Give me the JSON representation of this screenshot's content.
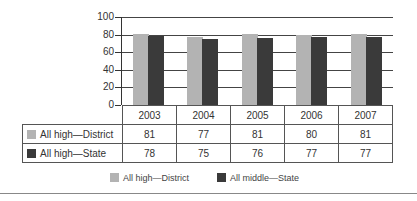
{
  "chart_data": {
    "type": "bar",
    "title": "",
    "xlabel": "",
    "ylabel": "",
    "ylim": [
      0,
      100
    ],
    "yticks": [
      0,
      20,
      40,
      60,
      80,
      100
    ],
    "grid": true,
    "categories": [
      "2003",
      "2004",
      "2005",
      "2006",
      "2007"
    ],
    "series": [
      {
        "name": "All high—District",
        "color": "#b3b3b3",
        "values": [
          81,
          77,
          81,
          80,
          81
        ]
      },
      {
        "name": "All high—State",
        "color": "#3a3a3a",
        "values": [
          78,
          75,
          76,
          77,
          77
        ]
      }
    ],
    "data_table": true,
    "legend": {
      "position": "bottom",
      "entries": [
        {
          "label": "All high—District",
          "color": "#b3b3b3"
        },
        {
          "label": "All middle—State",
          "color": "#3a3a3a"
        }
      ]
    }
  },
  "axis": {
    "y_labels": [
      "100",
      "80",
      "60",
      "40",
      "20",
      "0"
    ]
  },
  "table": {
    "headers": [
      "2003",
      "2004",
      "2005",
      "2006",
      "2007"
    ],
    "rows": [
      {
        "label": "All high—District",
        "values": [
          "81",
          "77",
          "81",
          "80",
          "81"
        ]
      },
      {
        "label": "All high—State",
        "values": [
          "78",
          "75",
          "76",
          "77",
          "77"
        ]
      }
    ]
  },
  "legend": {
    "items": [
      {
        "label": "All high—District"
      },
      {
        "label": "All middle—State"
      }
    ]
  }
}
